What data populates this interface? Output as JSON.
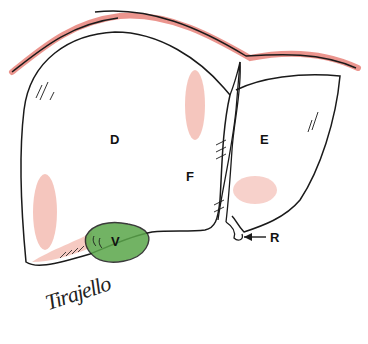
{
  "figure": {
    "colors": {
      "outline": "#1a1a1a",
      "diaphragm_shading": "#e8837a",
      "parenchyma_shading": "#f2b3a8",
      "gallbladder": "#5aa64a",
      "background": "#ffffff"
    },
    "labels": [
      {
        "id": "D",
        "text": "D",
        "x": 133,
        "y": 133
      },
      {
        "id": "E",
        "text": "E",
        "x": 260,
        "y": 133
      },
      {
        "id": "F",
        "text": "F",
        "x": 186,
        "y": 170
      },
      {
        "id": "V",
        "text": "V",
        "x": 111,
        "y": 235
      },
      {
        "id": "R",
        "text": "R",
        "x": 270,
        "y": 234
      }
    ],
    "arrow": {
      "from_label": "R",
      "direction": "left"
    },
    "signature": "Tirajello"
  }
}
